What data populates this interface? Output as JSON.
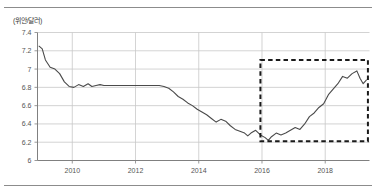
{
  "figure": {
    "unit_label": "(위안/달러)",
    "has_top_rule": true,
    "has_bottom_rule": true,
    "rule_color": "#8c8c8c",
    "background": "#ffffff"
  },
  "chart_data": {
    "type": "line",
    "title": "",
    "subtitle": "",
    "xlabel": "",
    "ylabel": "(위안/달러)",
    "unit": "위안/달러",
    "grid": true,
    "legend": "none",
    "line_color": "#4a4a4a",
    "grid_color": "#c8c8c8",
    "axis_color": "#808080",
    "xlim": [
      2008.9,
      2019.4
    ],
    "ylim": [
      6,
      7.4
    ],
    "yticks": [
      6,
      6.2,
      6.4,
      6.6,
      6.8,
      7,
      7.2,
      7.4
    ],
    "ytick_labels": [
      "6",
      "6.2",
      "6.4",
      "6.6",
      "6.8",
      "7",
      "7.2",
      "7.4"
    ],
    "xticks": [
      2010,
      2012,
      2014,
      2016,
      2018
    ],
    "xtick_labels": [
      "2010",
      "2012",
      "2014",
      "2016",
      "2018"
    ],
    "series": [
      {
        "name": "USD/CNY",
        "x": [
          2008.95,
          2009.05,
          2009.15,
          2009.3,
          2009.45,
          2009.6,
          2009.75,
          2009.9,
          2010.05,
          2010.2,
          2010.35,
          2010.5,
          2010.62,
          2010.75,
          2010.88,
          2011.0,
          2011.12,
          2011.25,
          2011.4,
          2011.55,
          2011.7,
          2011.85,
          2012.0,
          2012.15,
          2012.3,
          2012.45,
          2012.6,
          2012.75,
          2012.9,
          2013.05,
          2013.2,
          2013.35,
          2013.5,
          2013.65,
          2013.8,
          2013.95,
          2014.1,
          2014.25,
          2014.4,
          2014.55,
          2014.7,
          2014.85,
          2015.0,
          2015.15,
          2015.3,
          2015.45,
          2015.55,
          2015.65,
          2015.8,
          2015.95,
          2016.1,
          2016.2,
          2016.3,
          2016.45,
          2016.6,
          2016.75,
          2016.9,
          2017.05,
          2017.2,
          2017.35,
          2017.5,
          2017.65,
          2017.8,
          2017.95,
          2018.1,
          2018.25,
          2018.4,
          2018.55,
          2018.7,
          2018.85,
          2019.0,
          2019.1,
          2019.2,
          2019.3
        ],
        "y": [
          7.25,
          7.22,
          7.1,
          7.02,
          7.0,
          6.95,
          6.86,
          6.81,
          6.8,
          6.83,
          6.81,
          6.84,
          6.81,
          6.82,
          6.83,
          6.82,
          6.82,
          6.82,
          6.82,
          6.82,
          6.82,
          6.82,
          6.82,
          6.82,
          6.82,
          6.82,
          6.82,
          6.82,
          6.81,
          6.79,
          6.75,
          6.7,
          6.67,
          6.63,
          6.6,
          6.56,
          6.53,
          6.5,
          6.46,
          6.42,
          6.45,
          6.43,
          6.38,
          6.34,
          6.32,
          6.3,
          6.27,
          6.3,
          6.33,
          6.28,
          6.25,
          6.22,
          6.26,
          6.3,
          6.28,
          6.3,
          6.33,
          6.36,
          6.34,
          6.4,
          6.48,
          6.52,
          6.58,
          6.62,
          6.72,
          6.78,
          6.84,
          6.92,
          6.9,
          6.95,
          6.98,
          6.9,
          6.84,
          6.88
        ]
      }
    ],
    "annotations": [
      {
        "type": "dashed-rectangle",
        "name": "highlight-box",
        "x_range": [
          2015.95,
          2019.35
        ],
        "y_range": [
          6.21,
          7.1
        ],
        "style": "dashed",
        "color": "#1a1a1a"
      }
    ]
  }
}
